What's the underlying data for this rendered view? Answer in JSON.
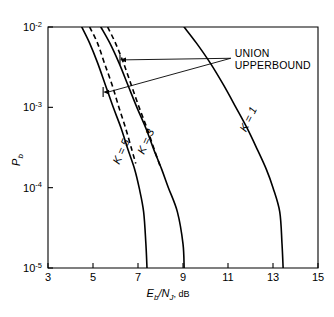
{
  "chart_data": {
    "type": "line",
    "title": "",
    "subtitle": "",
    "xlabel": "E_b/N_J, dB",
    "xlabel_parts": {
      "e": "E",
      "e_sub": "b",
      "slash": "/",
      "n": "N",
      "n_sub": "J",
      "unit": ", dB"
    },
    "ylabel": "P_b",
    "ylabel_parts": {
      "p": "P",
      "p_sub": "b"
    },
    "x_scale": "linear",
    "y_scale": "log",
    "xlim": [
      3,
      15
    ],
    "ylim": [
      1e-05,
      0.01
    ],
    "xticks": [
      3,
      5,
      7,
      9,
      11,
      13,
      15
    ],
    "xtick_labels": [
      "3",
      "5",
      "7",
      "9",
      "11",
      "13",
      "15"
    ],
    "yticks": [
      0.01,
      0.001,
      0.0001,
      1e-05
    ],
    "ytick_labels": [
      "10-2",
      "10-3",
      "10-4",
      "10-5"
    ],
    "ytick_label_parts": [
      {
        "base": "10",
        "exp": "-2"
      },
      {
        "base": "10",
        "exp": "-3"
      },
      {
        "base": "10",
        "exp": "-4"
      },
      {
        "base": "10",
        "exp": "-5"
      }
    ],
    "grid": false,
    "legend": "inline-curve-labels",
    "series": [
      {
        "name": "K = 1",
        "style": "solid",
        "label": "K = 1",
        "points": [
          [
            9.05,
            0.01
          ],
          [
            9.6,
            0.0063
          ],
          [
            10.2,
            0.0036
          ],
          [
            10.8,
            0.0019
          ],
          [
            11.35,
            0.001
          ],
          [
            11.85,
            0.00055
          ],
          [
            12.3,
            0.0003
          ],
          [
            12.7,
            0.00017
          ],
          [
            13.0,
            0.0001
          ],
          [
            13.3,
            5e-05
          ],
          [
            13.4,
            2e-05
          ],
          [
            13.45,
            1e-05
          ]
        ]
      },
      {
        "name": "K = 3",
        "style": "solid",
        "label": "K = 3",
        "points": [
          [
            5.35,
            0.01
          ],
          [
            5.75,
            0.0063
          ],
          [
            6.15,
            0.0036
          ],
          [
            6.55,
            0.0019
          ],
          [
            6.95,
            0.001
          ],
          [
            7.35,
            0.00055
          ],
          [
            7.7,
            0.0003
          ],
          [
            8.05,
            0.00017
          ],
          [
            8.35,
            0.0001
          ],
          [
            8.75,
            5e-05
          ],
          [
            9.0,
            2e-05
          ],
          [
            9.05,
            1e-05
          ]
        ]
      },
      {
        "name": "K = 3 union upperbound",
        "style": "dashed",
        "label": "UNION UPPERBOUND",
        "points": [
          [
            5.65,
            0.01
          ],
          [
            6.0,
            0.0063
          ],
          [
            6.35,
            0.0036
          ],
          [
            6.7,
            0.0019
          ],
          [
            7.05,
            0.001
          ],
          [
            7.4,
            0.00055
          ],
          [
            7.72,
            0.0003
          ],
          [
            8.0,
            0.00018
          ]
        ]
      },
      {
        "name": "K = 5",
        "style": "solid",
        "label": "K = 5",
        "points": [
          [
            4.5,
            0.01
          ],
          [
            4.85,
            0.0063
          ],
          [
            5.2,
            0.0036
          ],
          [
            5.55,
            0.0019
          ],
          [
            5.9,
            0.001
          ],
          [
            6.25,
            0.00055
          ],
          [
            6.55,
            0.0003
          ],
          [
            6.85,
            0.00017
          ],
          [
            7.05,
            0.0001
          ],
          [
            7.25,
            5e-05
          ],
          [
            7.35,
            2e-05
          ],
          [
            7.4,
            1e-05
          ]
        ]
      },
      {
        "name": "K = 5 union upperbound",
        "style": "dashed",
        "label": "UNION UPPERBOUND",
        "points": [
          [
            4.85,
            0.01
          ],
          [
            5.2,
            0.0063
          ],
          [
            5.5,
            0.0036
          ],
          [
            5.85,
            0.0019
          ],
          [
            6.15,
            0.001
          ],
          [
            6.45,
            0.00055
          ],
          [
            6.72,
            0.0003
          ],
          [
            6.9,
            0.0002
          ]
        ]
      }
    ],
    "annotations": [
      {
        "name": "union-upperbound",
        "text_line_1": "UNION",
        "text_line_2": "UPPERBOUND",
        "text_x": 11.3,
        "text_y": 0.0042,
        "leader_targets": [
          {
            "x": 6.2,
            "y": 0.0039
          },
          {
            "x": 5.45,
            "y": 0.00155
          }
        ]
      }
    ],
    "curve_labels": [
      {
        "text": "K = 1",
        "x": 12.05,
        "y": 0.00068
      },
      {
        "text": "K = 3",
        "x": 7.5,
        "y": 0.00036
      },
      {
        "text": "K = 5",
        "x": 6.4,
        "y": 0.00027
      }
    ]
  }
}
